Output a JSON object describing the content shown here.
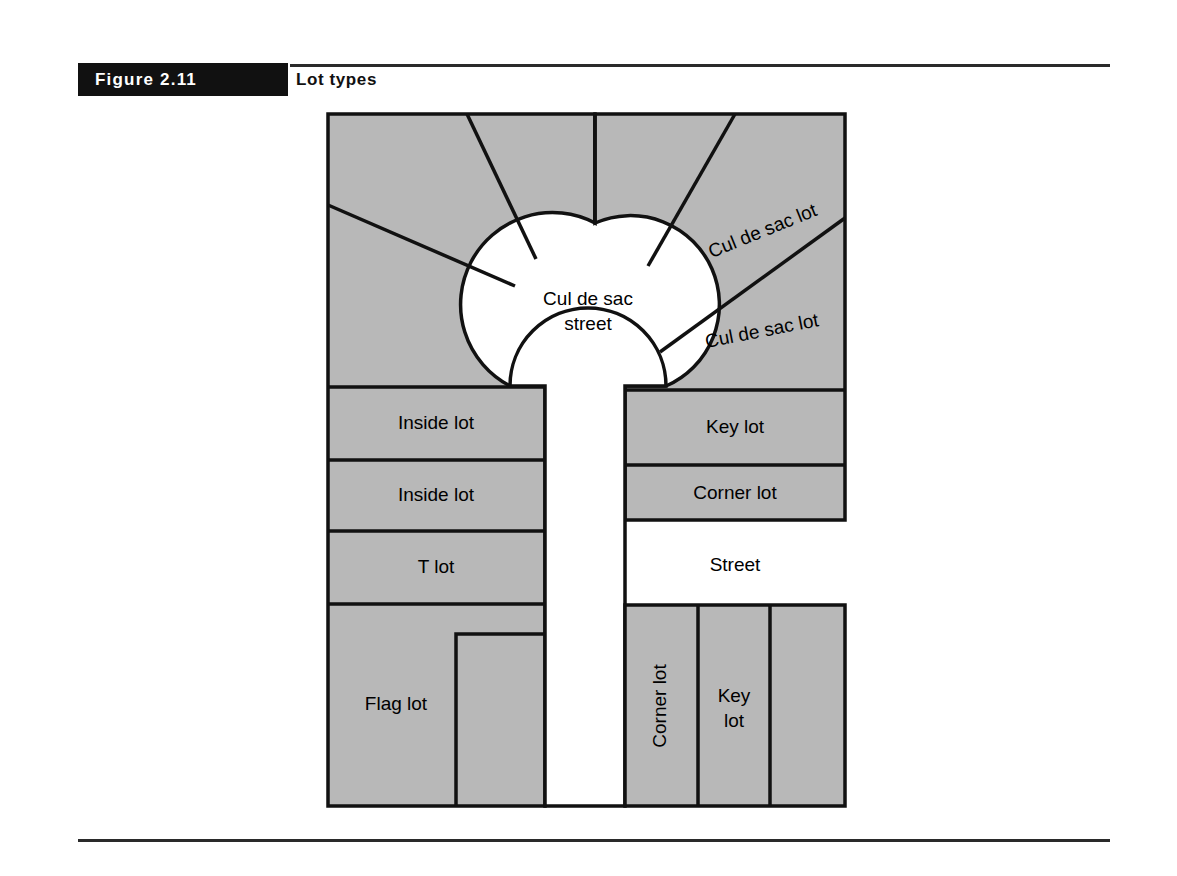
{
  "figure": {
    "tag": "Figure 2.11",
    "title": "Lot types"
  },
  "colors": {
    "lot_fill": "#b8b8b8",
    "lot_stroke": "#111111",
    "street_fill": "#ffffff",
    "tag_background": "#111111",
    "tag_text": "#ffffff",
    "rule": "#2a2a2a"
  },
  "diagram": {
    "cul_de_sac": {
      "street_label_line1": "Cul de sac",
      "street_label_line2": "street",
      "lot_label_upper": "Cul de sac lot",
      "lot_label_lower": "Cul de sac lot"
    },
    "left_column_lots": [
      {
        "label": "Inside lot"
      },
      {
        "label": "Inside lot"
      },
      {
        "label": "T lot"
      },
      {
        "label": "Flag lot"
      }
    ],
    "right_column_lots": [
      {
        "label": "Key lot"
      },
      {
        "label": "Corner lot"
      }
    ],
    "street_label": "Street",
    "bottom_block_lots": [
      {
        "label": "Corner lot",
        "orientation": "vertical"
      },
      {
        "label_line1": "Key",
        "label_line2": "lot",
        "orientation": "horizontal"
      },
      {
        "label": "",
        "orientation": "none"
      }
    ]
  }
}
